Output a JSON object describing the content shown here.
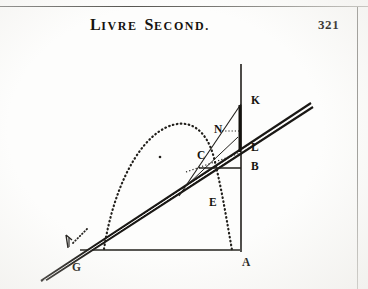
{
  "page": {
    "running_head_initial_1": "L",
    "running_head_rest_1": "IVRE",
    "running_head_initial_2": "S",
    "running_head_rest_2": "ECOND.",
    "folio": "321",
    "ink_color": "#15130f",
    "paper_color": "#fdfdfc",
    "rule_color": "#55544f"
  },
  "figure": {
    "name": "projectile-trajectory-diagram",
    "labels": [
      {
        "id": "K",
        "text": "K",
        "x": 251,
        "y": 104
      },
      {
        "id": "N",
        "text": "N",
        "x": 214,
        "y": 133
      },
      {
        "id": "C",
        "text": "C",
        "x": 199,
        "y": 158
      },
      {
        "id": "L",
        "text": "L",
        "x": 251,
        "y": 151
      },
      {
        "id": "B",
        "text": "B",
        "x": 251,
        "y": 170
      },
      {
        "id": "E",
        "text": "E",
        "x": 211,
        "y": 205
      },
      {
        "id": "A",
        "text": "A",
        "x": 243,
        "y": 265
      },
      {
        "id": "G",
        "text": "G",
        "x": 74,
        "y": 270
      }
    ],
    "elements": {
      "vertical_line": "K-A vertical axis",
      "base_line": "G-A horizontal base",
      "inclined_double_line": "tangent / inclined plane through G and C",
      "dotted_parabola": "projectile trajectory from G through apex down to A",
      "focus_dot": "small point inside the parabola",
      "segment_c_b": "short horizontal chord from C to B",
      "segment_k_c": "line from K down through C",
      "segment_n_c": "line from N to C region",
      "angle_mark_g": "small angle tick at G"
    }
  }
}
